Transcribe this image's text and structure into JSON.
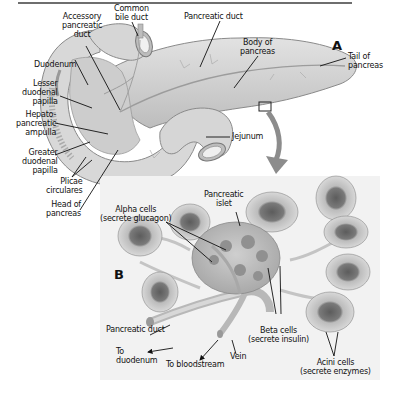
{
  "figure": {
    "panel_a_letter": "A",
    "panel_b_letter": "B",
    "colors": {
      "rule": "#6e6e6e",
      "organ_fill": "#d4d4d4",
      "organ_stroke": "#8a8a8a",
      "panel_b_bg": "#f2f2f2",
      "arrow": "#8c8c8c",
      "acini_outer": "#c8c8c8",
      "acini_inner": "#6a6a6a",
      "leader_line": "#111111"
    }
  },
  "panel_a": {
    "labels": {
      "common_bile_duct": "Common\nbile duct",
      "accessory_pancreatic_duct": "Accessory\npancreatic\nduct",
      "pancreatic_duct": "Pancreatic duct",
      "body_of_pancreas": "Body of\npancreas",
      "tail_of_pancreas": "Tail of\npancreas",
      "duodenum": "Duodenum",
      "lesser_duodenal_papilla": "Lesser\nduodenal\npapilla",
      "hepatopancreatic_ampulla": "Hepato-\npancreatic\nampulla",
      "greater_duodenal_papilla": "Greater\nduodenal\npapilla",
      "plicae_circulares": "Plicae\ncirculares",
      "head_of_pancreas": "Head of\npancreas",
      "jejunum": "Jejunum"
    }
  },
  "panel_b": {
    "labels": {
      "pancreatic_islet": "Pancreatic\nislet",
      "alpha_cells": "Alpha cells\n(secrete glucagon)",
      "beta_cells": "Beta cells\n(secrete insulin)",
      "pancreatic_duct": "Pancreatic duct",
      "to_duodenum": "To\nduodenum",
      "to_bloodstream": "To bloodstream",
      "vein": "Vein",
      "acini_cells": "Acini cells\n(secrete enzymes)"
    }
  }
}
